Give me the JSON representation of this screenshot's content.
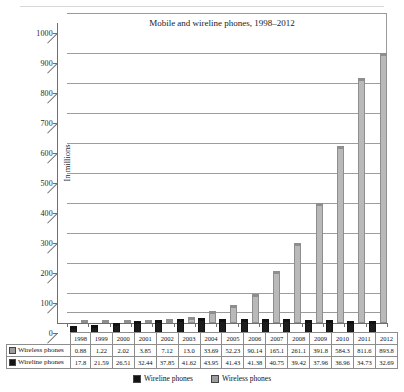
{
  "top_caption": "",
  "chart_data": {
    "type": "bar",
    "title": "Mobile and wireline phones, 1998–2012",
    "xlabel": "",
    "ylabel": "In millions",
    "ylim": [
      0,
      1000
    ],
    "ytick_step": 100,
    "yticks": [
      "0",
      "100",
      "200",
      "300",
      "400",
      "500",
      "600",
      "700",
      "800",
      "900",
      "1000"
    ],
    "grid": true,
    "legend_position": "bottom",
    "categories": [
      "1998",
      "1999",
      "2000",
      "2001",
      "2002",
      "2003",
      "2004",
      "2005",
      "2006",
      "2007",
      "2008",
      "2009",
      "2010",
      "2011",
      "2012"
    ],
    "series": [
      {
        "name": "Wireless phones",
        "color": "#b9b9b9",
        "values": [
          0.88,
          1.22,
          2.02,
          3.85,
          7.12,
          13.0,
          33.69,
          52.23,
          90.14,
          165.1,
          261.1,
          391.8,
          584.3,
          811.6,
          893.8
        ],
        "labels": [
          "0.88",
          "1.22",
          "2.02",
          "3.85",
          "7.12",
          "13.0",
          "33.69",
          "52.23",
          "90.14",
          "165.1",
          "261.1",
          "391.8",
          "584.3",
          "811.6",
          "893.8"
        ]
      },
      {
        "name": "Wireline phones",
        "color": "#1c1c1c",
        "values": [
          17.8,
          21.59,
          26.51,
          32.44,
          37.85,
          41.62,
          43.95,
          41.43,
          41.38,
          40.75,
          39.42,
          37.96,
          36.96,
          34.73,
          32.69
        ],
        "labels": [
          "17.8",
          "21.59",
          "26.51",
          "32.44",
          "37.85",
          "41.62",
          "43.95",
          "41.43",
          "41.38",
          "40.75",
          "39.42",
          "37.96",
          "36.96",
          "34.73",
          "32.69"
        ]
      }
    ]
  },
  "table": {
    "row_header_wireless": "Wireless phones",
    "row_header_wireline": "Wireline phones"
  },
  "legend": {
    "items": [
      {
        "label": "Wireline phones",
        "color": "#141414"
      },
      {
        "label": "Wireless phones",
        "color": "#9d9d9d"
      }
    ]
  }
}
